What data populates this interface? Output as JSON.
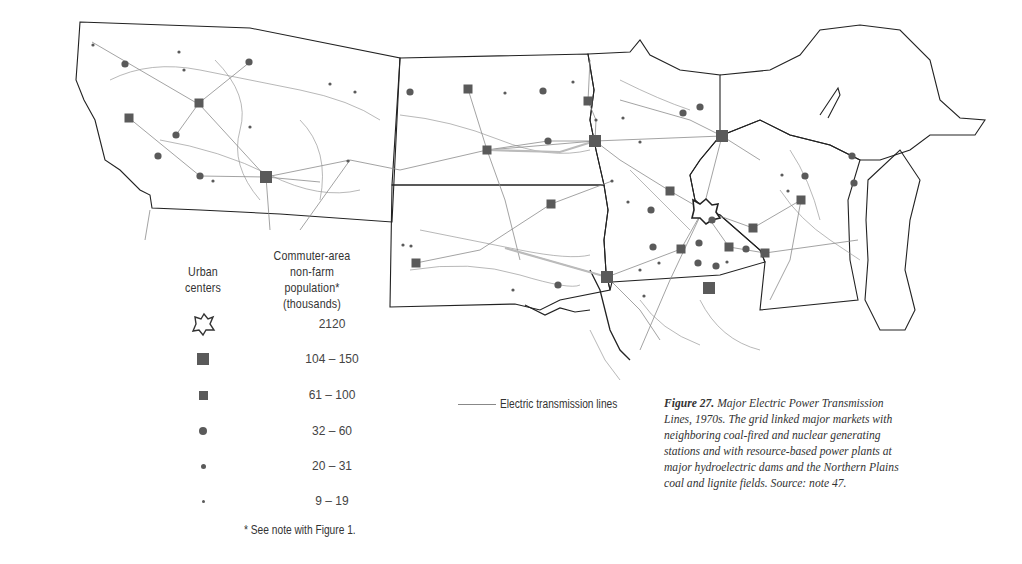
{
  "figure": {
    "number_label": "Figure 27.",
    "caption": "Major Electric Power Transmission Lines, 1970s. The grid linked major markets with neighboring coal-fired and nuclear generating stations and with resource-based power plants at major hydroelectric dams and the Northern Plains coal and lignite fields. Source: note 47."
  },
  "legend": {
    "symbol_header": "Urban centers",
    "value_header_line1": "Commuter-area",
    "value_header_line2": "non-farm population*",
    "value_header_line3": "(thousands)",
    "classes": [
      {
        "symbol": "outline-metro",
        "label": "2120"
      },
      {
        "symbol": "large-square",
        "label": "104 – 150"
      },
      {
        "symbol": "small-square",
        "label": "61 – 100"
      },
      {
        "symbol": "large-dot",
        "label": "32 – 60"
      },
      {
        "symbol": "medium-dot",
        "label": "20 – 31"
      },
      {
        "symbol": "small-dot",
        "label": "9 – 19"
      }
    ],
    "footnote": "* See note with Figure 1.",
    "line_label": "Electric transmission lines"
  },
  "colors": {
    "symbol_fill": "#5a5a5a",
    "border": "#222222",
    "transmission_line": "#999999",
    "major_line": "#bbbbbb"
  },
  "map": {
    "regions": [
      "Montana",
      "North Dakota",
      "South Dakota",
      "Minnesota",
      "Wisconsin",
      "Upper Michigan"
    ],
    "urban_centers": [
      {
        "type": "large-square",
        "x": 266,
        "y": 177
      },
      {
        "type": "large-square",
        "x": 595,
        "y": 141
      },
      {
        "type": "large-square",
        "x": 607,
        "y": 277
      },
      {
        "type": "large-square",
        "x": 722,
        "y": 136
      },
      {
        "type": "large-square",
        "x": 709,
        "y": 288
      },
      {
        "type": "small-square",
        "x": 199,
        "y": 103
      },
      {
        "type": "small-square",
        "x": 129,
        "y": 118
      },
      {
        "type": "small-square",
        "x": 468,
        "y": 89
      },
      {
        "type": "small-square",
        "x": 487,
        "y": 150
      },
      {
        "type": "small-square",
        "x": 588,
        "y": 101
      },
      {
        "type": "small-square",
        "x": 551,
        "y": 204
      },
      {
        "type": "small-square",
        "x": 416,
        "y": 263
      },
      {
        "type": "small-square",
        "x": 670,
        "y": 191
      },
      {
        "type": "small-square",
        "x": 681,
        "y": 249
      },
      {
        "type": "small-square",
        "x": 729,
        "y": 247
      },
      {
        "type": "small-square",
        "x": 753,
        "y": 228
      },
      {
        "type": "small-square",
        "x": 765,
        "y": 253
      },
      {
        "type": "small-square",
        "x": 801,
        "y": 200
      },
      {
        "type": "large-dot",
        "x": 125,
        "y": 64
      },
      {
        "type": "large-dot",
        "x": 176,
        "y": 135
      },
      {
        "type": "large-dot",
        "x": 158,
        "y": 156
      },
      {
        "type": "large-dot",
        "x": 200,
        "y": 176
      },
      {
        "type": "large-dot",
        "x": 249,
        "y": 62
      },
      {
        "type": "large-dot",
        "x": 410,
        "y": 92
      },
      {
        "type": "large-dot",
        "x": 543,
        "y": 91
      },
      {
        "type": "large-dot",
        "x": 548,
        "y": 141
      },
      {
        "type": "large-dot",
        "x": 683,
        "y": 113
      },
      {
        "type": "large-dot",
        "x": 700,
        "y": 107
      },
      {
        "type": "large-dot",
        "x": 651,
        "y": 210
      },
      {
        "type": "large-dot",
        "x": 712,
        "y": 220
      },
      {
        "type": "large-dot",
        "x": 699,
        "y": 243
      },
      {
        "type": "large-dot",
        "x": 698,
        "y": 263
      },
      {
        "type": "large-dot",
        "x": 716,
        "y": 266
      },
      {
        "type": "large-dot",
        "x": 854,
        "y": 183
      },
      {
        "type": "large-dot",
        "x": 852,
        "y": 156
      },
      {
        "type": "large-dot",
        "x": 805,
        "y": 176
      },
      {
        "type": "large-dot",
        "x": 653,
        "y": 247
      },
      {
        "type": "large-dot",
        "x": 746,
        "y": 249
      },
      {
        "type": "large-dot",
        "x": 558,
        "y": 285
      },
      {
        "type": "small-dot",
        "x": 93,
        "y": 45
      },
      {
        "type": "small-dot",
        "x": 179,
        "y": 52
      },
      {
        "type": "small-dot",
        "x": 184,
        "y": 70
      },
      {
        "type": "small-dot",
        "x": 250,
        "y": 127
      },
      {
        "type": "small-dot",
        "x": 213,
        "y": 181
      },
      {
        "type": "small-dot",
        "x": 330,
        "y": 84
      },
      {
        "type": "small-dot",
        "x": 355,
        "y": 92
      },
      {
        "type": "small-dot",
        "x": 348,
        "y": 161
      },
      {
        "type": "small-dot",
        "x": 505,
        "y": 93
      },
      {
        "type": "small-dot",
        "x": 573,
        "y": 82
      },
      {
        "type": "small-dot",
        "x": 596,
        "y": 120
      },
      {
        "type": "small-dot",
        "x": 623,
        "y": 118
      },
      {
        "type": "small-dot",
        "x": 640,
        "y": 142
      },
      {
        "type": "small-dot",
        "x": 612,
        "y": 181
      },
      {
        "type": "small-dot",
        "x": 628,
        "y": 202
      },
      {
        "type": "small-dot",
        "x": 513,
        "y": 290
      },
      {
        "type": "small-dot",
        "x": 403,
        "y": 245
      },
      {
        "type": "small-dot",
        "x": 411,
        "y": 246
      },
      {
        "type": "small-dot",
        "x": 644,
        "y": 296
      },
      {
        "type": "small-dot",
        "x": 659,
        "y": 263
      },
      {
        "type": "small-dot",
        "x": 727,
        "y": 262
      },
      {
        "type": "small-dot",
        "x": 788,
        "y": 191
      },
      {
        "type": "small-dot",
        "x": 782,
        "y": 175
      },
      {
        "type": "small-dot",
        "x": 640,
        "y": 270
      }
    ],
    "metro_outline": {
      "label": "Minneapolis-St. Paul",
      "x": 703,
      "y": 210
    }
  }
}
